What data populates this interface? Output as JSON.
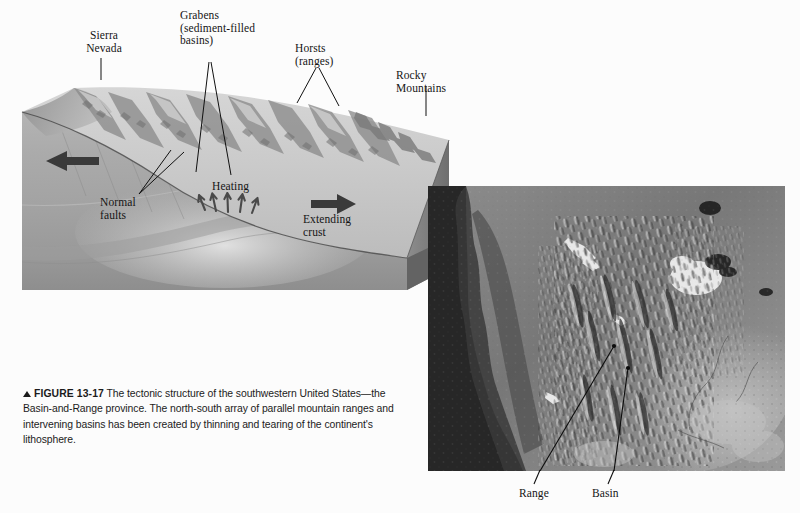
{
  "figure": {
    "number": "13-17",
    "marker_icon": "up-triangle-icon",
    "caption_label": "FIGURE",
    "caption_text": "The tectonic structure of the southwestern United States—the Basin-and-Range province. The north-south array of parallel mountain ranges and intervening basins has been created by thinning and tearing of the continent's lithosphere."
  },
  "block_diagram": {
    "name": "basin-and-range-block-diagram",
    "labels": {
      "sierra_nevada": "Sierra\nNevada",
      "grabens": "Grabens\n(sediment-filled\nbasins)",
      "horsts": "Horsts\n(ranges)",
      "rocky_mountains": "Rocky\nMountains",
      "normal_faults": "Normal\nfaults",
      "heating": "Heating",
      "extending_crust": "Extending\ncrust"
    },
    "arrows": {
      "left_extension": "arrow-left-icon",
      "right_extension": "arrow-right-icon",
      "heating_rise": "arrow-up-icon"
    }
  },
  "satellite_photo": {
    "name": "basin-and-range-satellite-image",
    "labels": {
      "range": "Range",
      "basin": "Basin"
    }
  },
  "colors": {
    "page_background": "#fcfcfc",
    "text": "#151515",
    "caption_text": "#1b1b1b",
    "block_front_face": "#a8a8a8",
    "block_side_face": "#8a8a8a",
    "block_top_surface": "#c9c9c9",
    "photo_dark_ocean": "#2a2a2a",
    "leader_line": "#101010"
  }
}
